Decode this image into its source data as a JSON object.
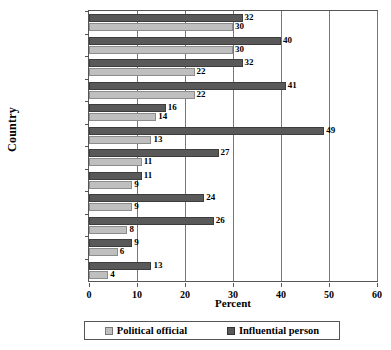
{
  "chart_data": {
    "type": "bar",
    "orientation": "horizontal",
    "title": "",
    "xlabel": "Percent",
    "ylabel": "Country",
    "xlim": [
      0,
      60
    ],
    "xticks": [
      0,
      10,
      20,
      30,
      40,
      50,
      60
    ],
    "grid": true,
    "legend_position": "bottom",
    "categories": [
      "Zimbabwe",
      "Namibia",
      "Zambia",
      "Uganda",
      "Lesotho",
      "Nigeria",
      "Ghana",
      "Botswana",
      "Malawi",
      "Tanzania",
      "South Africa",
      "Mali"
    ],
    "series": [
      {
        "name": "Influential person",
        "color": "#595959",
        "values": [
          32,
          40,
          32,
          41,
          16,
          49,
          27,
          11,
          24,
          26,
          9,
          13
        ]
      },
      {
        "name": "Political official",
        "color": "#bfbfbf",
        "values": [
          30,
          30,
          22,
          22,
          14,
          13,
          11,
          9,
          9,
          8,
          6,
          4
        ]
      }
    ]
  }
}
